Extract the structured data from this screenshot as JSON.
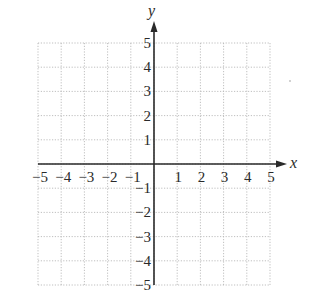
{
  "chart_data": {
    "type": "scatter",
    "title": "",
    "xlabel": "x",
    "ylabel": "y",
    "xlim": [
      -5,
      5
    ],
    "ylim": [
      -5,
      5
    ],
    "grid": true,
    "grid_style": "dotted",
    "x_ticks": [
      -5,
      -4,
      -3,
      -2,
      -1,
      1,
      2,
      3,
      4,
      5
    ],
    "y_ticks": [
      5,
      4,
      3,
      2,
      1,
      -1,
      -2,
      -3,
      -4,
      -5
    ],
    "x_tick_labels": [
      "−5",
      "−4",
      "−3",
      "−2",
      "−1",
      "1",
      "2",
      "3",
      "4",
      "5"
    ],
    "y_tick_labels": [
      "5",
      "4",
      "3",
      "2",
      "1",
      "−1",
      "−2",
      "−3",
      "−4",
      "−5"
    ],
    "series": [],
    "legend": null,
    "axis_arrows": {
      "x_positive": true,
      "y_positive": true
    }
  },
  "colors": {
    "axis": "#2a2a2a",
    "grid": "#b8b8b8",
    "background": "#ffffff"
  },
  "layout": {
    "origin_px": [
      154,
      164
    ],
    "unit_px_x": 23.2,
    "unit_px_y": 24.2
  }
}
